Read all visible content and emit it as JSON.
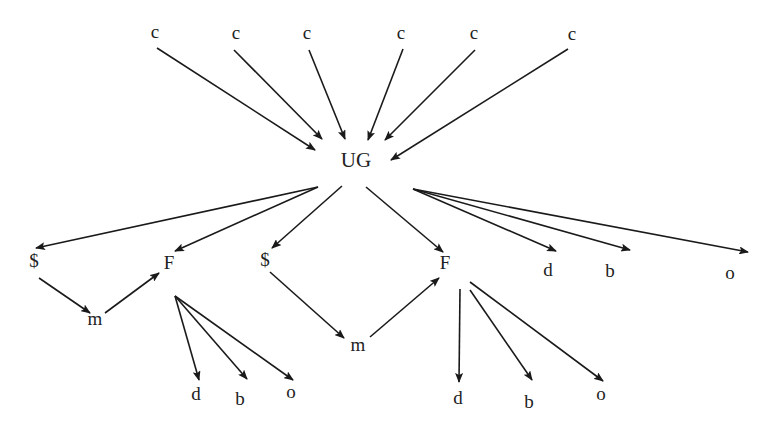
{
  "diagram": {
    "type": "directed-graph",
    "nodes": [
      {
        "id": "c1",
        "label": "c",
        "x": 155,
        "y": 34
      },
      {
        "id": "c2",
        "label": "c",
        "x": 236,
        "y": 35
      },
      {
        "id": "c3",
        "label": "c",
        "x": 307,
        "y": 35
      },
      {
        "id": "c4",
        "label": "c",
        "x": 401,
        "y": 35
      },
      {
        "id": "c5",
        "label": "c",
        "x": 474,
        "y": 35
      },
      {
        "id": "c6",
        "label": "c",
        "x": 572,
        "y": 36
      },
      {
        "id": "UG",
        "label": "UG",
        "x": 356,
        "y": 162
      },
      {
        "id": "s1",
        "label": "$",
        "x": 34,
        "y": 263
      },
      {
        "id": "F1",
        "label": "F",
        "x": 169,
        "y": 265
      },
      {
        "id": "m1",
        "label": "m",
        "x": 95,
        "y": 321
      },
      {
        "id": "s2",
        "label": "$",
        "x": 265,
        "y": 262
      },
      {
        "id": "F2",
        "label": "F",
        "x": 445,
        "y": 265
      },
      {
        "id": "m2",
        "label": "m",
        "x": 358,
        "y": 347
      },
      {
        "id": "d1",
        "label": "d",
        "x": 548,
        "y": 272
      },
      {
        "id": "b1",
        "label": "b",
        "x": 610,
        "y": 273
      },
      {
        "id": "o1",
        "label": "o",
        "x": 730,
        "y": 275
      },
      {
        "id": "d2",
        "label": "d",
        "x": 196,
        "y": 396
      },
      {
        "id": "b2",
        "label": "b",
        "x": 240,
        "y": 401
      },
      {
        "id": "o2",
        "label": "o",
        "x": 291,
        "y": 394
      },
      {
        "id": "d3",
        "label": "d",
        "x": 458,
        "y": 400
      },
      {
        "id": "b3",
        "label": "b",
        "x": 529,
        "y": 404
      },
      {
        "id": "o3",
        "label": "o",
        "x": 601,
        "y": 396
      }
    ],
    "edges": [
      {
        "from": "c1",
        "to": "UG",
        "x1": 157,
        "y1": 48,
        "x2": 315,
        "y2": 150
      },
      {
        "from": "c2",
        "to": "UG",
        "x1": 234,
        "y1": 50,
        "x2": 322,
        "y2": 139
      },
      {
        "from": "c3",
        "to": "UG",
        "x1": 309,
        "y1": 50,
        "x2": 345,
        "y2": 139
      },
      {
        "from": "c4",
        "to": "UG",
        "x1": 403,
        "y1": 49,
        "x2": 368,
        "y2": 140
      },
      {
        "from": "c5",
        "to": "UG",
        "x1": 475,
        "y1": 50,
        "x2": 385,
        "y2": 140
      },
      {
        "from": "c6",
        "to": "UG",
        "x1": 568,
        "y1": 49,
        "x2": 391,
        "y2": 160
      },
      {
        "from": "UG",
        "to": "s1",
        "x1": 318,
        "y1": 187,
        "x2": 36,
        "y2": 248
      },
      {
        "from": "UG",
        "to": "F1",
        "x1": 318,
        "y1": 187,
        "x2": 175,
        "y2": 251
      },
      {
        "from": "UG",
        "to": "s2",
        "x1": 342,
        "y1": 186,
        "x2": 272,
        "y2": 248
      },
      {
        "from": "UG",
        "to": "F2",
        "x1": 366,
        "y1": 187,
        "x2": 443,
        "y2": 252
      },
      {
        "from": "UG",
        "to": "d1",
        "x1": 413,
        "y1": 189,
        "x2": 556,
        "y2": 251
      },
      {
        "from": "UG",
        "to": "b1",
        "x1": 413,
        "y1": 189,
        "x2": 630,
        "y2": 250
      },
      {
        "from": "UG",
        "to": "o1",
        "x1": 413,
        "y1": 189,
        "x2": 748,
        "y2": 252
      },
      {
        "from": "s1",
        "to": "m1",
        "x1": 39,
        "y1": 278,
        "x2": 90,
        "y2": 313
      },
      {
        "from": "m1",
        "to": "F1",
        "x1": 105,
        "y1": 313,
        "x2": 159,
        "y2": 273
      },
      {
        "from": "s2",
        "to": "m2",
        "x1": 270,
        "y1": 272,
        "x2": 344,
        "y2": 338
      },
      {
        "from": "m2",
        "to": "F2",
        "x1": 370,
        "y1": 337,
        "x2": 439,
        "y2": 278
      },
      {
        "from": "F1",
        "to": "d2",
        "x1": 175,
        "y1": 296,
        "x2": 199,
        "y2": 380
      },
      {
        "from": "F1",
        "to": "b2",
        "x1": 175,
        "y1": 296,
        "x2": 247,
        "y2": 379
      },
      {
        "from": "F1",
        "to": "o2",
        "x1": 175,
        "y1": 296,
        "x2": 293,
        "y2": 380
      },
      {
        "from": "F2",
        "to": "d3",
        "x1": 460,
        "y1": 289,
        "x2": 459,
        "y2": 382
      },
      {
        "from": "F2",
        "to": "b3",
        "x1": 470,
        "y1": 290,
        "x2": 532,
        "y2": 380
      },
      {
        "from": "F2",
        "to": "o3",
        "x1": 470,
        "y1": 282,
        "x2": 603,
        "y2": 381
      }
    ]
  }
}
